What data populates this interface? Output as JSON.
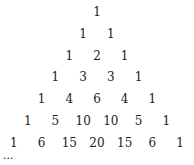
{
  "rows": [
    [
      1
    ],
    [
      1,
      1
    ],
    [
      1,
      2,
      1
    ],
    [
      1,
      3,
      3,
      1
    ],
    [
      1,
      4,
      6,
      4,
      1
    ],
    [
      1,
      5,
      10,
      10,
      5,
      1
    ],
    [
      1,
      6,
      15,
      20,
      15,
      6,
      1
    ]
  ],
  "ellipsis": "..."
}
